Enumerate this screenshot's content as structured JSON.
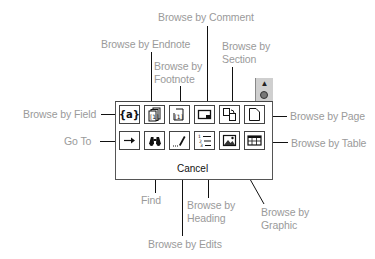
{
  "diagram": {
    "panel": {
      "cancel_label": "Cancel",
      "tab_icons": [
        "up-arrow-icon",
        "select-browse-object-icon"
      ],
      "rows": [
        [
          {
            "id": "field",
            "label": "Browse by Field",
            "icon": "field-braces-icon"
          },
          {
            "id": "endnote",
            "label": "Browse by Endnote",
            "icon": "endnote-icon"
          },
          {
            "id": "footnote",
            "label": "Browse by Footnote",
            "icon": "footnote-icon"
          },
          {
            "id": "comment",
            "label": "Browse by Comment",
            "icon": "comment-icon"
          },
          {
            "id": "section",
            "label": "Browse by Section",
            "icon": "section-icon"
          },
          {
            "id": "page",
            "label": "Browse by Page",
            "icon": "page-icon"
          }
        ],
        [
          {
            "id": "goto",
            "label": "Go To",
            "icon": "arrow-right-icon"
          },
          {
            "id": "find",
            "label": "Find",
            "icon": "binoculars-icon"
          },
          {
            "id": "edits",
            "label": "Browse by Edits",
            "icon": "pencil-icon"
          },
          {
            "id": "heading",
            "label": "Browse by Heading",
            "icon": "heading-list-icon"
          },
          {
            "id": "graphic",
            "label": "Browse by Graphic",
            "icon": "graphic-icon"
          },
          {
            "id": "table",
            "label": "Browse by Table",
            "icon": "table-icon"
          }
        ]
      ]
    },
    "callouts": {
      "comment": "Browse by Comment",
      "endnote": "Browse by Endnote",
      "footnote_1": "Browse by",
      "footnote_2": "Footnote",
      "section_1": "Browse by",
      "section_2": "Section",
      "field": "Browse by Field",
      "page": "Browse by Page",
      "goto": "Go To",
      "table": "Browse by Table",
      "find": "Find",
      "heading_1": "Browse by",
      "heading_2": "Heading",
      "graphic_1": "Browse by",
      "graphic_2": "Graphic",
      "edits": "Browse by Edits"
    }
  }
}
